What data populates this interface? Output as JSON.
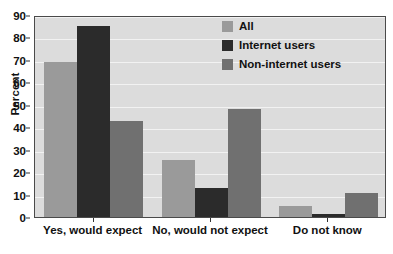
{
  "chart_data": {
    "type": "bar",
    "title": "",
    "xlabel": "",
    "ylabel": "Percent",
    "ylim": [
      0,
      90
    ],
    "yticks": [
      0,
      10,
      20,
      30,
      40,
      50,
      60,
      70,
      80,
      90
    ],
    "ytick_labels": [
      "0",
      "10",
      "20",
      "30",
      "40",
      "50",
      "60",
      "70",
      "80",
      "90"
    ],
    "grid": true,
    "legend_position": "upper right",
    "categories": [
      "Yes, would expect",
      "No, would not expect",
      "Do not know"
    ],
    "series": [
      {
        "name": "All",
        "color": "#9a9a9a",
        "values": [
          69,
          25.5,
          5
        ]
      },
      {
        "name": "Internet users",
        "color": "#2b2b2b",
        "values": [
          85,
          13,
          1.5
        ]
      },
      {
        "name": "Non-internet users",
        "color": "#707070",
        "values": [
          43,
          48,
          10.5
        ]
      }
    ]
  },
  "style": {
    "plot_background": "#dcdcdc",
    "gridline_color": "#f2f2f2",
    "axis_color": "#4a4a4a",
    "text_color": "#111111",
    "page_background": "#ffffff"
  }
}
